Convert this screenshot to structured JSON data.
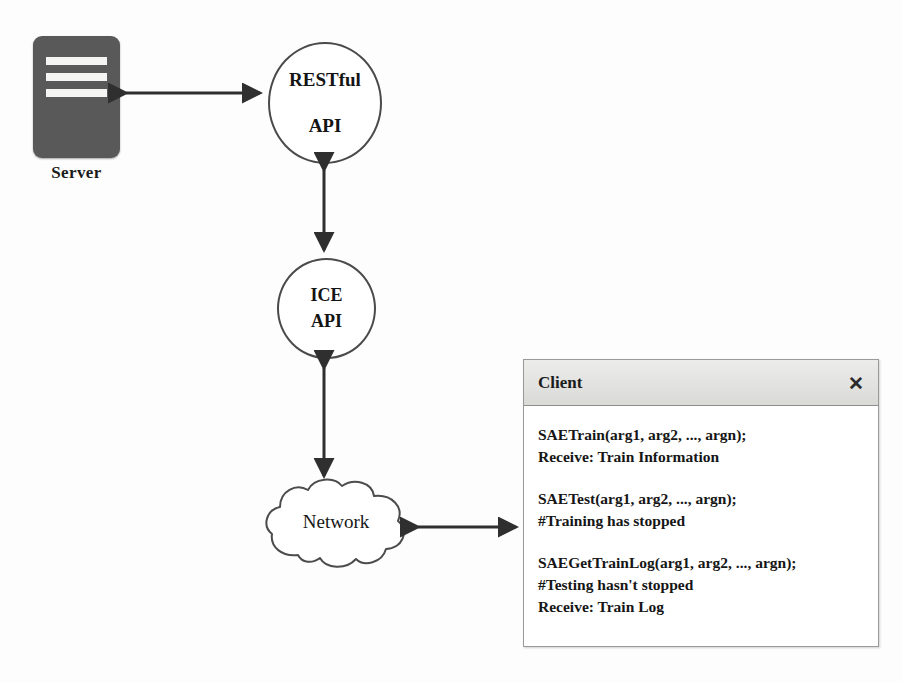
{
  "diagram": {
    "server": {
      "label": "Server",
      "icon": "server-rack-icon",
      "color": "#59595a",
      "bar_color": "#f4f4f2"
    },
    "nodes": [
      {
        "id": "restful-api",
        "line1": "RESTful",
        "line2": "API",
        "shape": "circle"
      },
      {
        "id": "ice-api",
        "line1": "ICE",
        "line2": "API",
        "shape": "circle"
      },
      {
        "id": "network",
        "label": "Network",
        "shape": "cloud"
      }
    ],
    "connections": [
      {
        "from": "server",
        "to": "restful-api",
        "style": "double-arrow",
        "orientation": "horizontal"
      },
      {
        "from": "restful-api",
        "to": "ice-api",
        "style": "double-arrow",
        "orientation": "vertical"
      },
      {
        "from": "ice-api",
        "to": "network",
        "style": "double-arrow",
        "orientation": "vertical"
      },
      {
        "from": "network",
        "to": "client-window",
        "style": "double-arrow",
        "orientation": "horizontal"
      }
    ],
    "stroke_color": "#3a3a3a"
  },
  "client_window": {
    "title": "Client",
    "close_label": "✕",
    "blocks": [
      {
        "lines": [
          "SAETrain(arg1, arg2, ..., argn);",
          "Receive: Train Information"
        ]
      },
      {
        "lines": [
          "SAETest(arg1, arg2, ..., argn);",
          "#Training has stopped"
        ]
      },
      {
        "lines": [
          "SAEGetTrainLog(arg1, arg2, ..., argn);",
          "#Testing hasn't stopped",
          "Receive:  Train Log"
        ]
      }
    ]
  }
}
